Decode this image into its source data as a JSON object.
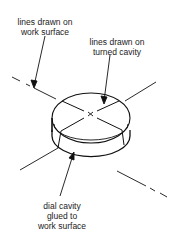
{
  "labels": {
    "work_surface_line1": "lines drawn on",
    "work_surface_line2": "work surface",
    "turned_cavity_line1": "lines drawn on",
    "turned_cavity_line2": "turned cavity",
    "dial_cavity_line1": "dial cavity",
    "dial_cavity_line2": "glued to",
    "dial_cavity_line3": "work surface"
  },
  "colors": {
    "stroke": "#111111",
    "text": "#222222",
    "background": "#ffffff"
  }
}
